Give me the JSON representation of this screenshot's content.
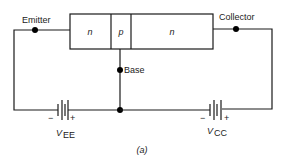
{
  "diagram": {
    "type": "npn-transistor-bias-circuit",
    "transistor": {
      "regions": [
        {
          "label": "n",
          "role": "emitter-region"
        },
        {
          "label": "p",
          "role": "base-region"
        },
        {
          "label": "n",
          "role": "collector-region"
        }
      ]
    },
    "terminals": {
      "emitter": "Emitter",
      "base": "Base",
      "collector": "Collector"
    },
    "sources": {
      "vee": {
        "name": "V",
        "subscript": "EE",
        "minus": "−",
        "plus": "+"
      },
      "vcc": {
        "name": "V",
        "subscript": "CC",
        "minus": "−",
        "plus": "+"
      }
    },
    "caption": "(a)"
  }
}
